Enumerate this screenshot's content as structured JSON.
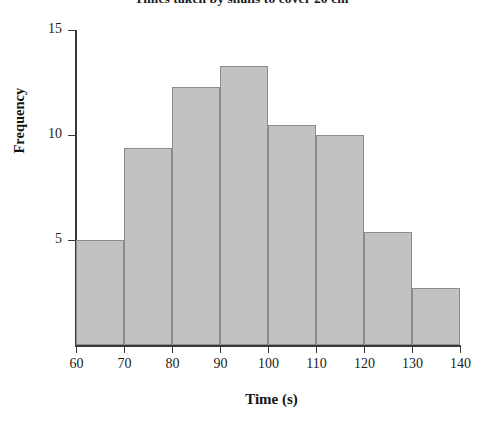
{
  "chart_data": {
    "type": "bar",
    "title": "Times taken by snails to cover 20 cm",
    "xlabel": "Time (s)",
    "ylabel": "Frequency",
    "categories": [
      "60-70",
      "70-80",
      "80-90",
      "90-100",
      "100-110",
      "110-120",
      "120-130",
      "130-140"
    ],
    "bin_edges": [
      60,
      70,
      80,
      90,
      100,
      110,
      120,
      130,
      140
    ],
    "values": [
      5.0,
      9.4,
      12.3,
      13.3,
      10.5,
      10.0,
      5.4,
      2.7
    ],
    "xlim": [
      60,
      140
    ],
    "ylim": [
      0,
      15
    ],
    "x_ticks": [
      60,
      70,
      80,
      90,
      100,
      110,
      120,
      130,
      140
    ],
    "x_tick_labels": [
      "60",
      "70",
      "80",
      "90",
      "100",
      "110",
      "120",
      "130",
      "140"
    ],
    "y_ticks": [
      5,
      10,
      15
    ],
    "y_tick_labels": [
      "5",
      "10",
      "15"
    ],
    "grid": false,
    "legend": null,
    "colors": {
      "bar_fill": "#c2c2c2",
      "bar_border": "#8d8d8d",
      "axis": "#3a3a3a",
      "text": "#1a1a1a",
      "background": "#ffffff"
    }
  }
}
